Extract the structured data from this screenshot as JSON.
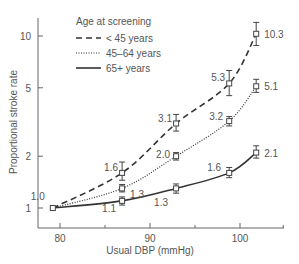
{
  "chart_data": {
    "type": "line",
    "title": "",
    "xlabel": "Usual DBP (mmHg)",
    "ylabel": "Proportional stroke rate",
    "yscale": "log",
    "xlim": [
      77,
      104
    ],
    "ylim": [
      0.85,
      12
    ],
    "x_ticks": [
      80,
      90,
      100
    ],
    "x_minor_ticks": [
      85,
      95,
      104.8
    ],
    "y_ticks": [
      1,
      2,
      5,
      10
    ],
    "grid": false,
    "legend": {
      "title": "Age at screening",
      "position": "upper-left",
      "entries": [
        "< 45 years",
        "45–64 years",
        "65+ years"
      ]
    },
    "x": [
      79.2,
      86.9,
      92.9,
      98.8,
      101.8
    ],
    "series": [
      {
        "name": "< 45 years",
        "style": "dashed",
        "values": [
          1.0,
          1.6,
          3.1,
          5.3,
          10.3
        ],
        "ci_low": [
          1.0,
          1.45,
          2.8,
          4.5,
          8.8
        ],
        "ci_high": [
          1.0,
          1.85,
          3.5,
          6.3,
          12.0
        ],
        "labels": [
          "1.0",
          "1.6",
          "3.1",
          "5.3",
          "10.3"
        ]
      },
      {
        "name": "45–64 years",
        "style": "dotted",
        "values": [
          1.0,
          1.3,
          2.0,
          3.2,
          5.1
        ],
        "ci_low": [
          1.0,
          1.24,
          1.9,
          3.0,
          4.7
        ],
        "ci_high": [
          1.0,
          1.37,
          2.1,
          3.4,
          5.6
        ],
        "labels": [
          "",
          "1.3",
          "2.0",
          "3.2",
          "5.1"
        ]
      },
      {
        "name": "65+ years",
        "style": "solid",
        "values": [
          1.0,
          1.1,
          1.3,
          1.6,
          2.1
        ],
        "ci_low": [
          1.0,
          1.04,
          1.22,
          1.5,
          1.95
        ],
        "ci_high": [
          1.0,
          1.16,
          1.38,
          1.72,
          2.3
        ],
        "labels": [
          "",
          "1.1",
          "1.3",
          "1.6",
          "2.1"
        ]
      }
    ]
  }
}
